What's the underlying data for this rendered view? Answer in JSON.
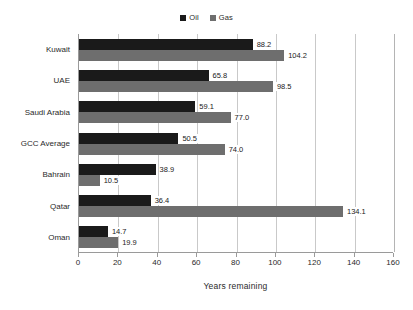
{
  "chart_data": {
    "type": "bar",
    "orientation": "horizontal",
    "title": "",
    "xlabel": "Years remaining",
    "ylabel": "",
    "xlim": [
      0,
      160
    ],
    "xticks": [
      0,
      20,
      40,
      60,
      80,
      100,
      120,
      140,
      160
    ],
    "grid": true,
    "legend_position": "top-center",
    "categories": [
      "Kuwait",
      "UAE",
      "Saudi Arabia",
      "GCC Average",
      "Bahrain",
      "Qatar",
      "Oman"
    ],
    "series": [
      {
        "name": "Oil",
        "color": "#1a1a1a",
        "values": [
          88.2,
          65.8,
          59.1,
          50.5,
          38.9,
          36.4,
          14.7
        ],
        "labels": [
          "88.2",
          "65.8",
          "59.1",
          "50.5",
          "38.9",
          "36.4",
          "14.7"
        ]
      },
      {
        "name": "Gas",
        "color": "#6e6e6e",
        "values": [
          104.2,
          98.5,
          77.0,
          74.0,
          10.5,
          134.1,
          19.9
        ],
        "labels": [
          "104.2",
          "98.5",
          "77.0",
          "74.0",
          "10.5",
          "134.1",
          "19.9"
        ]
      }
    ],
    "tick_labels": [
      "0",
      "20",
      "40",
      "60",
      "80",
      "100",
      "120",
      "140",
      "160"
    ],
    "legend_entries": [
      "Oil",
      "Gas"
    ]
  }
}
